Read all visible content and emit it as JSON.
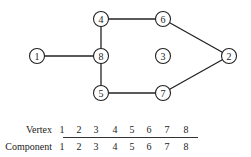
{
  "graph": {
    "nodes": [
      {
        "id": "1",
        "x": 37,
        "y": 56
      },
      {
        "id": "2",
        "x": 229,
        "y": 56
      },
      {
        "id": "3",
        "x": 163,
        "y": 56
      },
      {
        "id": "4",
        "x": 101,
        "y": 19
      },
      {
        "id": "5",
        "x": 101,
        "y": 93
      },
      {
        "id": "6",
        "x": 163,
        "y": 19
      },
      {
        "id": "7",
        "x": 163,
        "y": 93
      },
      {
        "id": "8",
        "x": 101,
        "y": 56
      }
    ],
    "edges": [
      [
        "1",
        "8"
      ],
      [
        "4",
        "8"
      ],
      [
        "8",
        "5"
      ],
      [
        "4",
        "6"
      ],
      [
        "6",
        "2"
      ],
      [
        "5",
        "7"
      ],
      [
        "7",
        "2"
      ]
    ],
    "node_radius": 7.5
  },
  "table": {
    "row_labels": {
      "vertex": "Vertex",
      "component": "Component"
    },
    "vertex": [
      "1",
      "2",
      "3",
      "4",
      "5",
      "6",
      "7",
      "8"
    ],
    "component": [
      "1",
      "2",
      "3",
      "4",
      "5",
      "6",
      "7",
      "8"
    ],
    "column_x": [
      62,
      79,
      96,
      115,
      132,
      149,
      167,
      186
    ]
  }
}
